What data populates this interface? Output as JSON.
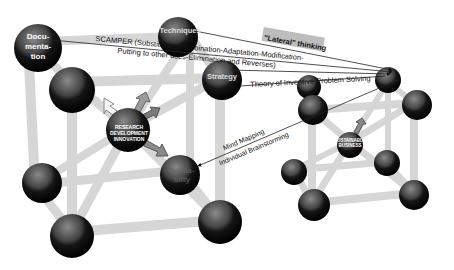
{
  "diagram": {
    "left_structure": {
      "center": {
        "line1": "RESEARCH",
        "line2": "DEVELOPMENT",
        "line3": "INNOVATION"
      },
      "nodes": {
        "documentation": {
          "line1": "Docu-",
          "line2": "menta-",
          "line3": "tion"
        },
        "techniques": "Techniques",
        "strategy": "Strategy",
        "availability": {
          "line1": "Availa-",
          "line2": "bility"
        }
      }
    },
    "right_structure": {
      "center": {
        "line1": "SUSTAINABLE",
        "line2": "BUSINESS"
      }
    },
    "annotations": {
      "scamper_line1": "SCAMPER (Substitution-Combination-Adaptation-Modification-",
      "scamper_line2": "Putting to other uses-Elimination and Reverses)",
      "lateral": "\"Lateral\" thinking",
      "triz": "Theory of Inventive Problem Solving",
      "mind_mapping": "Mind Mapping",
      "brainstorming": "Individual Brainstorming"
    },
    "colors": {
      "sphere_dark": "#111111",
      "sphere_mid": "#555555",
      "rod": "#dcdcdc",
      "arrow_white": "#f2f2f2",
      "arrow_gray": "#8a8a8a",
      "line": "#222222"
    }
  }
}
